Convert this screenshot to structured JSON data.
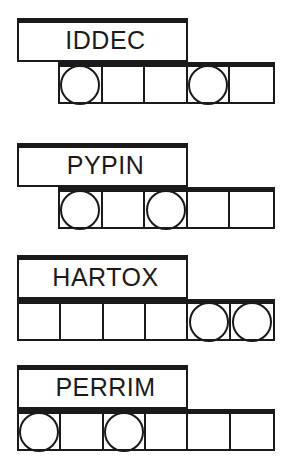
{
  "page": {
    "background_color": "#ffffff",
    "ink_color": "#1a1a1a"
  },
  "blocks": [
    {
      "id": "block-iddec",
      "label": "IDDEC",
      "top": 18,
      "row_alignment": "offset",
      "cell_count": 5,
      "cells": [
        {
          "index": 1,
          "has_circle": true
        },
        {
          "index": 2,
          "has_circle": false
        },
        {
          "index": 3,
          "has_circle": false
        },
        {
          "index": 4,
          "has_circle": true
        },
        {
          "index": 5,
          "has_circle": false
        }
      ],
      "circle_count": 2
    },
    {
      "id": "block-pypin",
      "label": "PYPIN",
      "top": 143,
      "row_alignment": "offset",
      "cell_count": 5,
      "cells": [
        {
          "index": 1,
          "has_circle": true
        },
        {
          "index": 2,
          "has_circle": false
        },
        {
          "index": 3,
          "has_circle": true
        },
        {
          "index": 4,
          "has_circle": false
        },
        {
          "index": 5,
          "has_circle": false
        }
      ],
      "circle_count": 2
    },
    {
      "id": "block-hartox",
      "label": "HARTOX",
      "top": 255,
      "row_alignment": "flush",
      "cell_count": 6,
      "cells": [
        {
          "index": 1,
          "has_circle": false
        },
        {
          "index": 2,
          "has_circle": false
        },
        {
          "index": 3,
          "has_circle": false
        },
        {
          "index": 4,
          "has_circle": false
        },
        {
          "index": 5,
          "has_circle": true
        },
        {
          "index": 6,
          "has_circle": true
        }
      ],
      "circle_count": 2
    },
    {
      "id": "block-perrim",
      "label": "PERRIM",
      "top": 365,
      "row_alignment": "flush",
      "cell_count": 6,
      "cells": [
        {
          "index": 1,
          "has_circle": true
        },
        {
          "index": 2,
          "has_circle": false
        },
        {
          "index": 3,
          "has_circle": true
        },
        {
          "index": 4,
          "has_circle": false
        },
        {
          "index": 5,
          "has_circle": false
        },
        {
          "index": 6,
          "has_circle": false
        }
      ],
      "circle_count": 2
    }
  ]
}
